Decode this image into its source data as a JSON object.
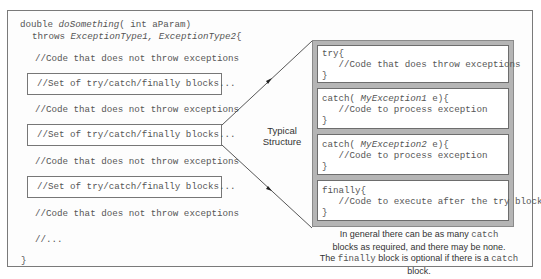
{
  "method": {
    "signature_prefix": "double ",
    "method_name": "doSomething",
    "signature_params": "( int aParam)",
    "throws_keyword": "throws ",
    "exception_types": "ExceptionType1, ExceptionType2",
    "open_brace": "{",
    "close_brace": "}"
  },
  "left_lines": [
    {
      "text": "//Code that does not throw exceptions"
    },
    {
      "text": "//Code that does not throw exceptions"
    },
    {
      "text": "//Code that does not throw exceptions"
    },
    {
      "text": "//Code that does not throw exceptions"
    },
    {
      "text": "//..."
    }
  ],
  "left_boxes": [
    {
      "text": "//Set of try/catch/finally blocks..."
    },
    {
      "text": "//Set of try/catch/finally blocks..."
    },
    {
      "text": "//Set of try/catch/finally blocks..."
    }
  ],
  "label": {
    "line1": "Typical",
    "line2": "Structure"
  },
  "structure_blocks": [
    {
      "head_prefix": "try{",
      "head_italic": "",
      "head_suffix": "",
      "body": "   //Code that does throw exceptions",
      "close": "}"
    },
    {
      "head_prefix": "catch( ",
      "head_italic": "MyException1",
      "head_suffix": " e){",
      "body": "   //Code to process exception",
      "close": "}"
    },
    {
      "head_prefix": "catch( ",
      "head_italic": "MyException2",
      "head_suffix": " e){",
      "body": "   //Code to process exception",
      "close": "}"
    },
    {
      "head_prefix": "finally{",
      "head_italic": "",
      "head_suffix": "",
      "body": "   //Code to execute after the try block",
      "close": "}"
    }
  ],
  "note": {
    "l1_a": "In general there can be as many ",
    "l1_code": "catch",
    "l2": "blocks as required, and there may be none.",
    "l3_a": "The ",
    "l3_code1": "finally",
    "l3_b": " block is optional if there is a ",
    "l3_code2": "catch",
    "l3_c": " block."
  }
}
